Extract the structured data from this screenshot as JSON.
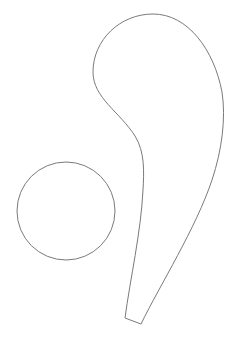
{
  "canvas": {
    "width": 240,
    "height": 348,
    "background": "#ffffff"
  },
  "stroke": {
    "color": "#7a7a7a",
    "width": 1
  },
  "shapes": {
    "circle": {
      "cx": 66,
      "cy": 211,
      "r": 49
    },
    "teardrop": {
      "path": "M 153 14 C 120 14, 93 40, 93 72 C 93 98, 120 112, 135 136 C 145 152, 144 172, 143 190 C 141 232, 130 280, 125 318 L 141 324 C 160 285, 196 228, 212 180 C 222 150, 226 118, 222 92 C 214 50, 188 14, 153 14 Z"
    }
  }
}
